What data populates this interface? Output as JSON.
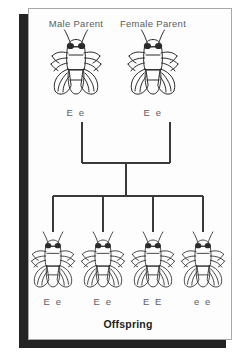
{
  "figure": {
    "kind": "genetics-pedigree-diagram",
    "offspring_label": "Offspring",
    "parents": [
      {
        "title": "Male Parent",
        "genotype": "E e",
        "cx": 76,
        "fly_y": 36,
        "title_y": 18,
        "geno_y": 107
      },
      {
        "title": "Female Parent",
        "genotype": "E e",
        "cx": 153,
        "fly_y": 36,
        "title_y": 18,
        "geno_y": 107
      }
    ],
    "offspring": [
      {
        "genotype": "E e",
        "cx": 53
      },
      {
        "genotype": "E e",
        "cx": 103
      },
      {
        "genotype": "E E",
        "cx": 153
      },
      {
        "genotype": "e e",
        "cx": 203
      }
    ],
    "offspring_fly_y": 232,
    "offspring_geno_y": 296,
    "offspring_label_x": 128,
    "offspring_label_y": 318,
    "colors": {
      "page_background": "#ffffff",
      "card_background": "#fdfdfd",
      "card_border": "#a8a8a8",
      "shadow": "#232323",
      "line": "#3a3a3a",
      "text": "#55575a",
      "heading_text": "#1d1d1d",
      "fly_outline": "#2b2b2b",
      "fly_eye": "#2b2b2b"
    },
    "pedigree_lines": {
      "parent_drop_top": 122,
      "parent_bar_y": 163,
      "parent_left_x": 82,
      "parent_right_x": 170,
      "center_x": 126,
      "offspring_bar_y": 196,
      "offspring_bar_left": 53,
      "offspring_bar_right": 203,
      "offspring_drop_bottom": 232
    }
  }
}
